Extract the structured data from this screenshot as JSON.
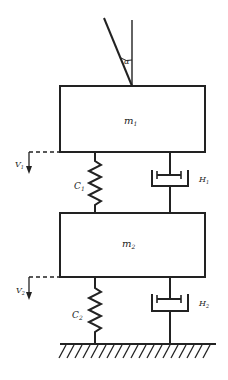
{
  "diagram": {
    "type": "two-mass spring-damper system",
    "angle_label": "α",
    "masses": [
      {
        "id": "m1",
        "label": "m",
        "subscript": "1"
      },
      {
        "id": "m2",
        "label": "m",
        "subscript": "2"
      }
    ],
    "springs": [
      {
        "id": "C1",
        "label": "C",
        "subscript": "1"
      },
      {
        "id": "C2",
        "label": "C",
        "subscript": "2"
      }
    ],
    "dampers": [
      {
        "id": "H1",
        "label": "H",
        "subscript": "1"
      },
      {
        "id": "H2",
        "label": "H",
        "subscript": "2"
      }
    ],
    "displacements": [
      {
        "id": "V1",
        "label": "V",
        "subscript": "1"
      },
      {
        "id": "V2",
        "label": "V",
        "subscript": "2"
      }
    ],
    "ground": "fixed ground (hatched)",
    "colors": {
      "line": "#222222",
      "background": "#ffffff"
    }
  }
}
